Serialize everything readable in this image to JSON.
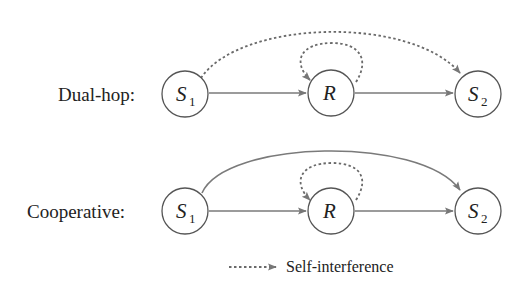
{
  "rows": [
    {
      "label": "Dual-hop:",
      "nodes": [
        {
          "main": "S",
          "sub": "1"
        },
        {
          "main": "R",
          "sub": ""
        },
        {
          "main": "S",
          "sub": "2"
        }
      ],
      "direct_link_style": "dotted"
    },
    {
      "label": "Cooperative:",
      "nodes": [
        {
          "main": "S",
          "sub": "1"
        },
        {
          "main": "R",
          "sub": ""
        },
        {
          "main": "S",
          "sub": "2"
        }
      ],
      "direct_link_style": "solid"
    }
  ],
  "legend": {
    "label": "Self-interference",
    "line_style": "dotted"
  },
  "colors": {
    "edge": "#7a7a7a",
    "node_stroke": "#555555",
    "text": "#222222"
  }
}
